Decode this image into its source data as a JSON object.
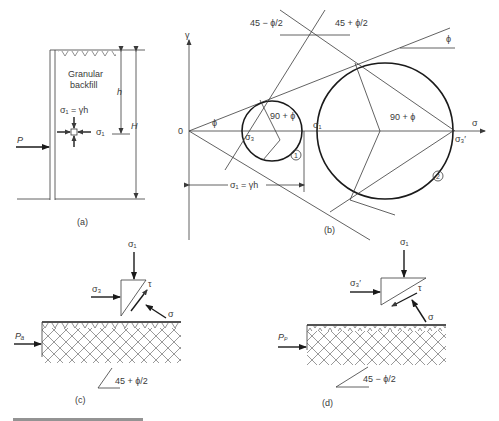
{
  "panel_a": {
    "label": "(a)",
    "material": "Granular",
    "material2": "backfill",
    "stress_vertical": "σ₁ = γh",
    "stress_horizontal": "σ₁",
    "depth_h": "h",
    "height_H": "H",
    "force": "P"
  },
  "panel_b": {
    "label": "(b)",
    "y_axis": "γ",
    "x_axis": "σ",
    "origin": "0",
    "angle_phi_left": "ϕ",
    "angle_phi_right": "ϕ",
    "angle_45_minus": "45 − ϕ/2",
    "angle_45_plus": "45 + ϕ/2",
    "angle_90_small": "90 + ϕ",
    "angle_90_large": "90 + ϕ",
    "sigma3": "σ₃",
    "sigma1": "σ₁",
    "sigma3_prime": "σ₃′",
    "circle1": "1",
    "circle2": "2",
    "dimension": "σ₁ = γh"
  },
  "panel_c": {
    "label": "(c)",
    "sigma1": "σ₁",
    "sigma3": "σ₃",
    "tau": "τ",
    "sigma": "σ",
    "force": "Pₐ",
    "angle": "45 + ϕ/2"
  },
  "panel_d": {
    "label": "(d)",
    "sigma1": "σ₁",
    "sigma3": "σ₃′",
    "tau": "τ",
    "sigma": "σ",
    "force": "Pₚ",
    "angle": "45 − ϕ/2"
  }
}
